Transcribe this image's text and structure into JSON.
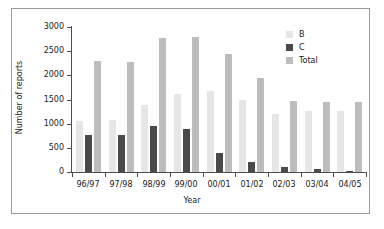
{
  "chart_data": {
    "type": "bar",
    "title": "",
    "xlabel": "Year",
    "ylabel": "Number of reports",
    "categories": [
      "96/97",
      "97/98",
      "98/99",
      "99/00",
      "00/01",
      "01/02",
      "02/03",
      "03/04",
      "04/05"
    ],
    "series": [
      {
        "name": "B",
        "color": "#e6e6e6",
        "values": [
          1050,
          1080,
          1380,
          1610,
          1670,
          1480,
          1200,
          1260,
          1260
        ]
      },
      {
        "name": "C",
        "color": "#4a4a4a",
        "values": [
          760,
          770,
          950,
          880,
          390,
          200,
          100,
          60,
          30
        ]
      },
      {
        "name": "Total",
        "color": "#bdbdbd",
        "values": [
          2300,
          2280,
          2780,
          2790,
          2440,
          1940,
          1460,
          1450,
          1450
        ]
      }
    ],
    "ylim": [
      0,
      3000
    ],
    "yticks": [
      0,
      500,
      1000,
      1500,
      2000,
      2500,
      3000
    ],
    "ytick_labels": [
      "0",
      "500",
      "1000",
      "1500",
      "2000",
      "2500",
      "3000"
    ],
    "grid": false,
    "legend_position": "top-right",
    "legend": [
      {
        "label": "B",
        "color": "#e6e6e6"
      },
      {
        "label": "C",
        "color": "#4a4a4a"
      },
      {
        "label": "Total",
        "color": "#bdbdbd"
      }
    ]
  },
  "figure": {
    "border_color": "#9b9b9b",
    "axis_color": "#4d4d4d",
    "background": "#ffffff"
  }
}
